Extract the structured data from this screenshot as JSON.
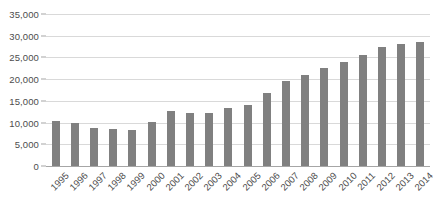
{
  "chart_data": {
    "type": "bar",
    "title": "",
    "subtitle": "",
    "xlabel": "",
    "ylabel": "",
    "categories": [
      "1995",
      "1996",
      "1997",
      "1998",
      "1999",
      "2000",
      "2001",
      "2002",
      "2003",
      "2004",
      "2005",
      "2006",
      "2007",
      "2008",
      "2009",
      "2010",
      "2011",
      "2012",
      "2013",
      "2014"
    ],
    "values": [
      10300,
      10000,
      8700,
      8600,
      8400,
      10200,
      12700,
      12200,
      12300,
      13300,
      14100,
      16800,
      19500,
      21000,
      22500,
      23900,
      25600,
      27300,
      28200,
      28500
    ],
    "series": [
      {
        "name": "",
        "values": [
          10300,
          10000,
          8700,
          8600,
          8400,
          10200,
          12700,
          12200,
          12300,
          13300,
          14100,
          16800,
          19500,
          21000,
          22500,
          23900,
          25600,
          27300,
          28200,
          28500
        ]
      }
    ],
    "ylim": [
      0,
      35000
    ],
    "ytick_values": [
      0,
      5000,
      10000,
      15000,
      20000,
      25000,
      30000,
      35000
    ],
    "ytick_labels": [
      "0",
      "5,000",
      "10,000",
      "15,000",
      "20,000",
      "25,000",
      "30,000",
      "35,000"
    ],
    "grid": true,
    "grid_axis": "y",
    "legend": false,
    "legend_position": "none",
    "annotations": [],
    "bar_color": "#808080",
    "gridline_color": "#d9d9d9",
    "axis_color": "#a6a6a6",
    "tick_label_color": "#4d4d4d",
    "background_color": "#ffffff",
    "xtick_rotation": -45
  }
}
